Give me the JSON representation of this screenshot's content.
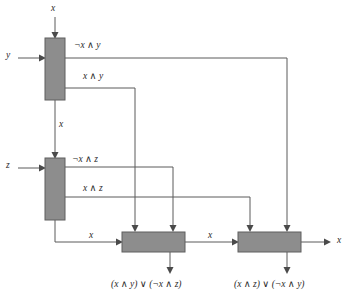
{
  "diagram": {
    "background_color": "#ffffff",
    "gate_fill_color": "#8d8d8d",
    "gate_stroke_color": "#5f5f5f",
    "wire_color": "#5a5a5a",
    "text_color": "#2b2b2b"
  },
  "inputs": {
    "top_x": "x",
    "left_y": "y",
    "left_z": "z"
  },
  "gates": [
    {
      "id": "gate-1",
      "name": "gate-top-left",
      "x": 45,
      "y": 38,
      "width": 20,
      "height": 62
    },
    {
      "id": "gate-2",
      "name": "gate-middle-left",
      "x": 45,
      "y": 158,
      "width": 20,
      "height": 62
    },
    {
      "id": "gate-3",
      "name": "gate-bottom-left",
      "x": 122,
      "y": 232,
      "width": 63,
      "height": 20
    },
    {
      "id": "gate-4",
      "name": "gate-bottom-right",
      "x": 238,
      "y": 232,
      "width": 63,
      "height": 20
    }
  ],
  "wire_labels": {
    "not_x_and_y": "¬x ∧ y",
    "x_and_y": "x ∧ y",
    "x_between_gate1_gate2": "x",
    "not_x_and_z": "¬x ∧ z",
    "x_and_z": "x ∧ z",
    "x_into_gate3": "x",
    "x_between_gate3_gate4": "x",
    "x_output": "x"
  },
  "outputs": {
    "gate3_output": "(x ∧ y) ∨ (¬x ∧ z)",
    "gate4_output": "(x ∧ z) ∨ (¬x ∧ y)",
    "right_output": "x"
  }
}
